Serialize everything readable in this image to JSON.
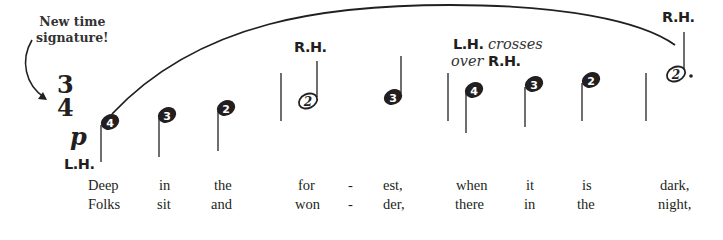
{
  "callout": {
    "line1": "New time",
    "line2": "signature!"
  },
  "time_signature": {
    "top": "3",
    "bottom": "4"
  },
  "dynamic": "p",
  "hand_labels": {
    "start": "L.H.",
    "measure2": "R.H.",
    "measure3_lh": "L.H.",
    "measure3_crosses": "crosses",
    "measure3_over": "over",
    "measure3_rh": "R.H.",
    "measure4": "R.H."
  },
  "notes": [
    {
      "finger": "4",
      "filled": true,
      "x": 110,
      "y": 122
    },
    {
      "finger": "3",
      "filled": true,
      "x": 167,
      "y": 115
    },
    {
      "finger": "2",
      "filled": true,
      "x": 226,
      "y": 108
    },
    {
      "finger": "2",
      "filled": false,
      "x": 307,
      "y": 99
    },
    {
      "finger": "3",
      "filled": true,
      "x": 392,
      "y": 97
    },
    {
      "finger": "4",
      "filled": true,
      "x": 474,
      "y": 90
    },
    {
      "finger": "3",
      "filled": true,
      "x": 534,
      "y": 84
    },
    {
      "finger": "2",
      "filled": true,
      "x": 591,
      "y": 80
    },
    {
      "finger": "2",
      "filled": false,
      "x": 675,
      "y": 73,
      "dotted": true
    }
  ],
  "lyrics": {
    "verse1": [
      "Deep",
      "in",
      "the",
      "for",
      "-",
      "est,",
      "when",
      "it",
      "is",
      "dark,"
    ],
    "verse2": [
      "Folks",
      "sit",
      "and",
      "won",
      "-",
      "der,",
      "there",
      "in",
      "the",
      "night,"
    ]
  }
}
